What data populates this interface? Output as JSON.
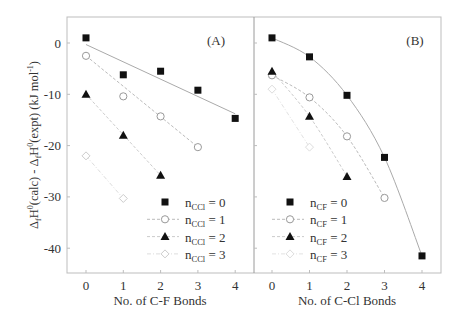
{
  "chart_data": [
    {
      "panel": "A",
      "type": "scatter",
      "title": "(A)",
      "xlabel": "No. of C-F Bonds",
      "ylabel": "ΔfH0(calc) - ΔfH0(expt)  (kJ mol-1)",
      "xticks": [
        0,
        1,
        2,
        3,
        4
      ],
      "yticks": [
        0,
        -10,
        -20,
        -30,
        -40
      ],
      "xlim": [
        -0.5,
        4.5
      ],
      "ylim": [
        -45,
        5
      ],
      "legend_position": "lower right",
      "series": [
        {
          "name": "n_CCl = 0",
          "label_base": "n",
          "label_sub": "CCl",
          "label_rest": " = 0",
          "marker": "square-filled",
          "line": "solid",
          "color": "#111111",
          "line_color": "#aaaaaa",
          "x": [
            0,
            1,
            2,
            3,
            4
          ],
          "y": [
            1.0,
            -6.2,
            -5.5,
            -9.2,
            -14.7
          ],
          "fit": {
            "x": [
              0,
              4
            ],
            "y": [
              -0.3,
              -13.8
            ]
          }
        },
        {
          "name": "n_CCl = 1",
          "label_base": "n",
          "label_sub": "CCl",
          "label_rest": " = 1",
          "marker": "circle-open",
          "line": "dashed",
          "color": "#999999",
          "line_color": "#bbbbbb",
          "x": [
            0,
            1,
            2,
            3
          ],
          "y": [
            -2.5,
            -10.4,
            -14.3,
            -20.3
          ],
          "fit": {
            "x": [
              0,
              3
            ],
            "y": [
              -2.5,
              -20.3
            ]
          }
        },
        {
          "name": "n_CCl = 2",
          "label_base": "n",
          "label_sub": "CCl",
          "label_rest": " = 2",
          "marker": "triangle-filled",
          "line": "dashed",
          "color": "#111111",
          "line_color": "#cccccc",
          "x": [
            0,
            1,
            2
          ],
          "y": [
            -10.0,
            -18.0,
            -25.8
          ],
          "fit": {
            "x": [
              0,
              2
            ],
            "y": [
              -10.0,
              -25.8
            ]
          }
        },
        {
          "name": "n_CCl = 3",
          "label_base": "n",
          "label_sub": "CCl",
          "label_rest": " = 3",
          "marker": "diamond-open",
          "line": "dash-dot",
          "color": "#cccccc",
          "line_color": "#dddddd",
          "x": [
            0,
            1
          ],
          "y": [
            -22.0,
            -30.3
          ],
          "fit": {
            "x": [
              0,
              1
            ],
            "y": [
              -22.0,
              -30.3
            ]
          }
        }
      ]
    },
    {
      "panel": "B",
      "type": "scatter",
      "title": "(B)",
      "xlabel": "No. of C-Cl Bonds",
      "ylabel": "",
      "xticks": [
        0,
        1,
        2,
        3,
        4
      ],
      "yticks": [
        0,
        -10,
        -20,
        -30,
        -40
      ],
      "xlim": [
        -0.5,
        4.5
      ],
      "ylim": [
        -45,
        5
      ],
      "legend_position": "lower left",
      "series": [
        {
          "name": "n_CF = 0",
          "label_base": "n",
          "label_sub": "CF",
          "label_rest": " = 0",
          "marker": "square-filled",
          "line": "solid",
          "color": "#111111",
          "line_color": "#aaaaaa",
          "x": [
            0,
            1,
            2,
            3,
            4
          ],
          "y": [
            1.0,
            -2.7,
            -10.2,
            -22.3,
            -41.5
          ]
        },
        {
          "name": "n_CF = 1",
          "label_base": "n",
          "label_sub": "CF",
          "label_rest": " = 1",
          "marker": "circle-open",
          "line": "dashed",
          "color": "#999999",
          "line_color": "#bbbbbb",
          "x": [
            0,
            1,
            2,
            3
          ],
          "y": [
            -6.3,
            -10.6,
            -18.2,
            -30.2
          ]
        },
        {
          "name": "n_CF = 2",
          "label_base": "n",
          "label_sub": "CF",
          "label_rest": " = 2",
          "marker": "triangle-filled",
          "line": "dashed",
          "color": "#111111",
          "line_color": "#cccccc",
          "x": [
            0,
            1,
            2
          ],
          "y": [
            -5.5,
            -14.3,
            -26.0
          ]
        },
        {
          "name": "n_CF = 3",
          "label_base": "n",
          "label_sub": "CF",
          "label_rest": " = 3",
          "marker": "diamond-open",
          "line": "dash-dot",
          "color": "#dddddd",
          "line_color": "#e2e2e2",
          "x": [
            0,
            1
          ],
          "y": [
            -9.0,
            -20.3
          ]
        }
      ]
    }
  ],
  "labels": {
    "panel_a_title": "(A)",
    "panel_b_title": "(B)",
    "xlabel_a": "No. of C-F Bonds",
    "xlabel_b": "No. of C-Cl Bonds"
  }
}
